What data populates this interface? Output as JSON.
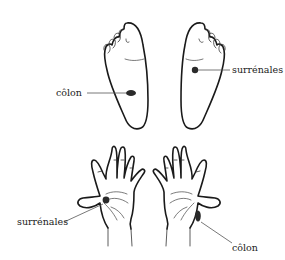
{
  "figure": {
    "feet": {
      "left_foot": {
        "point_label": "côlon",
        "point_shape": "oval"
      },
      "right_foot": {
        "point_label": "surrénales",
        "point_shape": "circle"
      }
    },
    "hands": {
      "left_hand": {
        "point_label": "surrénales",
        "point_shape": "circle"
      },
      "right_hand": {
        "point_label": "côlon",
        "point_shape": "elongated-oval"
      }
    },
    "colors": {
      "outline": "#1a1a1a",
      "point": "#2a2a2a",
      "background": "#ffffff"
    }
  }
}
